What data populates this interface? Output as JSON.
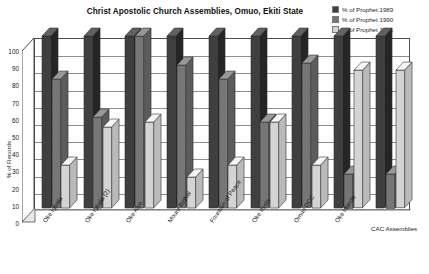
{
  "header": {
    "clipped_top_line": "",
    "title": "Christ Apostolic Church Assemblies, Omuo, Ekiti State"
  },
  "legend": {
    "position": "top-right",
    "items": [
      {
        "label": "% of Prophet 1989",
        "color": "#3f3f3f"
      },
      {
        "label": "% of Prophet 1990",
        "color": "#767676"
      },
      {
        "label": "% of Prophet 1991",
        "color": "#d4d4d4"
      }
    ]
  },
  "axes": {
    "y_title": "% of Records",
    "y_ticks": [
      "100",
      "90",
      "80",
      "70",
      "60",
      "50",
      "40",
      "30",
      "20",
      "10",
      "0"
    ]
  },
  "chart_data": {
    "type": "bar",
    "title": "Christ Apostolic Church Assemblies, Omuo, Ekiti State",
    "xlabel": "",
    "ylabel": "% of Records",
    "ylim": [
      0,
      100
    ],
    "ytick_step": 10,
    "grid": true,
    "legend_position": "top-right",
    "style": "3d-clustered-column",
    "categories": [
      "Oke Igbala",
      "Oke Igbala (2)",
      "Oke Aiyo",
      "Mount Bethel",
      "Fountain of Peace",
      "Oke Itsebi",
      "Omuo DCC",
      "Oke Idande",
      "CAC Assemblies"
    ],
    "series": [
      {
        "name": "% of Prophet 1989",
        "color": "#3f3f3f",
        "values": [
          100,
          100,
          100,
          100,
          100,
          100,
          100,
          100,
          100
        ]
      },
      {
        "name": "% of Prophet 1990",
        "color": "#767676",
        "values": [
          75,
          53,
          100,
          83,
          75,
          50,
          84,
          20,
          20
        ]
      },
      {
        "name": "% of Prophet 1991",
        "color": "#d4d4d4",
        "values": [
          25,
          47,
          50,
          18,
          25,
          50,
          25,
          80,
          80
        ]
      }
    ]
  }
}
